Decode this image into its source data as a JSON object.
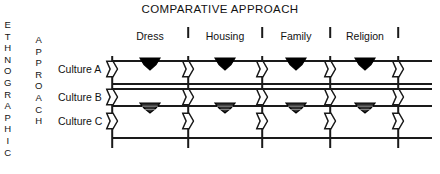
{
  "figure": {
    "title": "COMPARATIVE APPROACH",
    "width": 440,
    "height": 174,
    "background": "#ffffff",
    "ink_color": "#1a1a1a"
  },
  "axes": {
    "vertical_label_left": "ETHNOGRAPHIC",
    "vertical_label_right": "APPROACH"
  },
  "columns": [
    {
      "label": "Dress",
      "center_x": 150
    },
    {
      "label": "Housing",
      "center_x": 225
    },
    {
      "label": "Family",
      "center_x": 296
    },
    {
      "label": "Religion",
      "center_x": 365
    }
  ],
  "rows": [
    {
      "label": "Culture A",
      "center_y": 69
    },
    {
      "label": "Culture B",
      "center_y": 97
    },
    {
      "label": "Culture C",
      "center_y": 121
    }
  ],
  "grid": {
    "left_x": 112,
    "right_x": 432,
    "horizontal_lines_y": [
      60,
      83,
      88,
      105,
      137
    ],
    "vertical_divider_x": [
      112,
      188,
      262,
      330,
      398
    ],
    "vertical_top_y": 56,
    "vertical_bottom_y": 148,
    "header_tick_x": [
      188,
      262,
      330,
      398
    ],
    "header_tick_label": "column-divider-tick"
  },
  "markers": {
    "filled_line_y": 60,
    "shaded_line_y": 105,
    "open_marker_name": "open-chevron-marker",
    "filled_marker_name": "filled-chevron-marker",
    "shaded_marker_name": "shaded-chevron-marker",
    "filled_color": "#000000",
    "shaded_color": "#2e2e2e",
    "open_color": "#ffffff"
  },
  "chart_data": {
    "type": "diagram",
    "title": "COMPARATIVE APPROACH",
    "xlabel": "COMPARATIVE APPROACH",
    "ylabel": "ETHNOGRAPHIC APPROACH",
    "categories": [
      "Dress",
      "Housing",
      "Family",
      "Religion"
    ],
    "series": [
      {
        "name": "Culture A",
        "values": [
          "filled",
          "filled",
          "filled",
          "filled"
        ]
      },
      {
        "name": "Culture B",
        "values": [
          "open",
          "open",
          "open",
          "open"
        ]
      },
      {
        "name": "Culture C",
        "values": [
          "shaded",
          "shaded",
          "shaded",
          "shaded"
        ]
      }
    ],
    "legend": [],
    "grid": true
  }
}
